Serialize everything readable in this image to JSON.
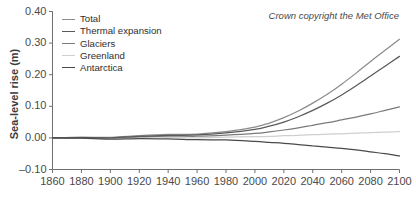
{
  "chart_data": {
    "type": "line",
    "title": "",
    "xlabel": "",
    "ylabel": "Sea-level rise (m)",
    "xlim": [
      1860,
      2100
    ],
    "ylim": [
      -0.1,
      0.4
    ],
    "xticks": [
      1860,
      1880,
      1900,
      1920,
      1940,
      1960,
      1980,
      2000,
      2020,
      2040,
      2060,
      2080,
      2100
    ],
    "yticks": [
      -0.1,
      0.0,
      0.1,
      0.2,
      0.3,
      0.4
    ],
    "ytick_labels": [
      "–0.10",
      "0.00",
      "0.10",
      "0.20",
      "0.30",
      "0.40"
    ],
    "xtick_labels": [
      "1860",
      "1880",
      "1900",
      "1920",
      "1940",
      "1960",
      "1980",
      "2000",
      "2020",
      "2040",
      "2060",
      "2080",
      "2100"
    ],
    "grid": false,
    "legend_position": "top-left",
    "annotation": "Crown copyright the Met Office",
    "x": [
      1860,
      1880,
      1900,
      1920,
      1940,
      1960,
      1980,
      2000,
      2010,
      2020,
      2030,
      2040,
      2050,
      2060,
      2070,
      2080,
      2090,
      2100
    ],
    "series": [
      {
        "name": "Total",
        "color": "#8c8c8c",
        "values": [
          0.0,
          0.002,
          0.003,
          0.006,
          0.01,
          0.013,
          0.019,
          0.034,
          0.047,
          0.064,
          0.085,
          0.11,
          0.138,
          0.17,
          0.205,
          0.242,
          0.277,
          0.312
        ]
      },
      {
        "name": "Thermal expansion",
        "color": "#5a5a5a",
        "values": [
          0.0,
          0.001,
          0.002,
          0.004,
          0.007,
          0.01,
          0.015,
          0.027,
          0.037,
          0.05,
          0.067,
          0.087,
          0.11,
          0.136,
          0.165,
          0.196,
          0.227,
          0.258
        ]
      },
      {
        "name": "Glaciers",
        "color": "#7a7a7a",
        "values": [
          0.0,
          0.001,
          0.002,
          0.003,
          0.005,
          0.006,
          0.008,
          0.014,
          0.019,
          0.025,
          0.032,
          0.04,
          0.048,
          0.057,
          0.066,
          0.076,
          0.087,
          0.098
        ]
      },
      {
        "name": "Greenland",
        "color": "#cfcfcf",
        "values": [
          0.0,
          0.0,
          0.0,
          0.001,
          0.001,
          0.001,
          0.002,
          0.004,
          0.005,
          0.007,
          0.008,
          0.01,
          0.012,
          0.013,
          0.015,
          0.017,
          0.018,
          0.02
        ]
      },
      {
        "name": "Antarctica",
        "color": "#4a4a4a",
        "values": [
          0.0,
          -0.001,
          -0.002,
          -0.003,
          -0.004,
          -0.005,
          -0.007,
          -0.011,
          -0.014,
          -0.017,
          -0.021,
          -0.025,
          -0.029,
          -0.033,
          -0.038,
          -0.044,
          -0.05,
          -0.057
        ]
      }
    ]
  },
  "axes": {
    "y_title": "Sea-level rise (m)",
    "frame_color": "#6e6e6e"
  },
  "legend": {
    "items": [
      {
        "label": "Total",
        "color": "#8c8c8c"
      },
      {
        "label": "Thermal expansion",
        "color": "#5a5a5a"
      },
      {
        "label": "Glaciers",
        "color": "#7a7a7a"
      },
      {
        "label": "Greenland",
        "color": "#cfcfcf"
      },
      {
        "label": "Antarctica",
        "color": "#4a4a4a"
      }
    ]
  },
  "credit": {
    "text": "Crown copyright the Met Office"
  }
}
